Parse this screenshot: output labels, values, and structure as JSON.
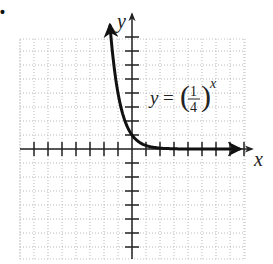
{
  "chart_data": {
    "type": "line",
    "title": "",
    "equation": "y = (1/4)^x",
    "equation_parts": {
      "lhs": "y",
      "eq": "=",
      "num": "1",
      "den": "4",
      "exp": "x"
    },
    "xlabel": "x",
    "ylabel": "y",
    "xlim": [
      -8,
      8
    ],
    "ylim": [
      -8,
      8
    ],
    "grid": true,
    "tick_spacing": 1,
    "tick_labels": false,
    "series": [
      {
        "name": "y = (1/4)^x",
        "x": [
          -1.8,
          -1.5,
          -1,
          -0.75,
          -0.5,
          -0.25,
          0,
          0.5,
          1,
          2,
          3,
          4,
          5,
          6,
          7
        ],
        "values": [
          12.1,
          8,
          4,
          2.83,
          2,
          1.41,
          1,
          0.5,
          0.25,
          0.0625,
          0.016,
          0.004,
          0.001,
          0.0002,
          0.0001
        ]
      }
    ],
    "arrows": {
      "curve_left_end": true,
      "curve_right_end": true,
      "x_axis_right": true,
      "y_axis_top": true
    }
  },
  "labels": {
    "bullet": "•",
    "x_axis": "x",
    "y_axis": "y"
  }
}
